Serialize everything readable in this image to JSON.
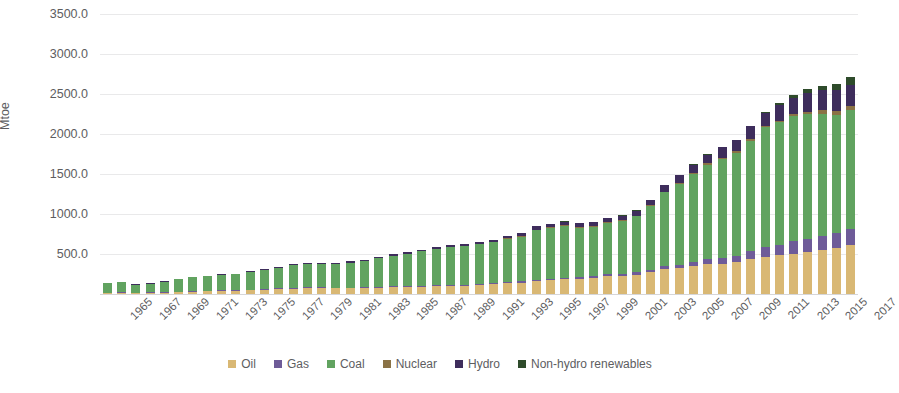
{
  "chart_data": {
    "type": "bar",
    "subtype": "stacked-column",
    "title": "",
    "xlabel": "",
    "ylabel": "Mtoe",
    "ylim": [
      0,
      3500
    ],
    "ytick_values": [
      0,
      500,
      1000,
      1500,
      2000,
      2500,
      3000,
      3500
    ],
    "ytick_labels": [
      "0.0",
      "500.0",
      "1000.0",
      "1500.0",
      "2000.0",
      "2500.0",
      "3000.0",
      "3500.0"
    ],
    "grid": true,
    "grid_axis": "y",
    "legend_position": "bottom",
    "x_tick_rotation": -45,
    "x_tick_step": 2,
    "categories": [
      "1965",
      "1966",
      "1967",
      "1968",
      "1969",
      "1970",
      "1971",
      "1972",
      "1973",
      "1974",
      "1975",
      "1976",
      "1977",
      "1978",
      "1979",
      "1980",
      "1981",
      "1982",
      "1983",
      "1984",
      "1985",
      "1986",
      "1987",
      "1988",
      "1989",
      "1990",
      "1991",
      "1992",
      "1993",
      "1994",
      "1995",
      "1996",
      "1997",
      "1998",
      "1999",
      "2000",
      "2001",
      "2002",
      "2003",
      "2004",
      "2005",
      "2006",
      "2007",
      "2008",
      "2009",
      "2010",
      "2011",
      "2012",
      "2013",
      "2014",
      "2015",
      "2016",
      "2017"
    ],
    "xtick_labels": [
      "1965",
      "1967",
      "1969",
      "1971",
      "1973",
      "1975",
      "1977",
      "1979",
      "1981",
      "1983",
      "1985",
      "1987",
      "1989",
      "1991",
      "1993",
      "1995",
      "1997",
      "1999",
      "2001",
      "2003",
      "2005",
      "2007",
      "2009",
      "2011",
      "2013",
      "2015",
      "2017"
    ],
    "series": [
      {
        "name": "Oil",
        "color": "#d9b874",
        "values": [
          11.0,
          13.5,
          11.0,
          12.5,
          16.5,
          22.0,
          28.0,
          32.0,
          38.0,
          41.0,
          48.0,
          52.0,
          60.0,
          68.0,
          74.0,
          74.0,
          70.0,
          70.0,
          72.0,
          77.0,
          83.0,
          88.0,
          92.0,
          97.0,
          102.0,
          104.0,
          113.0,
          123.0,
          136.0,
          142.0,
          159.0,
          170.0,
          187.0,
          190.0,
          204.0,
          224.0,
          226.0,
          243.0,
          269.0,
          317.0,
          326.0,
          352.0,
          375.0,
          381.0,
          400.0,
          442.0,
          465.0,
          487.0,
          506.0,
          523.0,
          553.0,
          577.0,
          608.0
        ]
      },
      {
        "name": "Gas",
        "color": "#6e5b98",
        "values": [
          0.9,
          1.1,
          1.0,
          1.2,
          1.5,
          2.2,
          3.0,
          3.8,
          4.8,
          6.0,
          7.5,
          9.0,
          10.5,
          12.0,
          13.0,
          12.5,
          11.5,
          11.0,
          11.0,
          11.5,
          11.5,
          12.0,
          12.5,
          12.8,
          13.5,
          13.5,
          14.0,
          14.5,
          15.0,
          15.5,
          15.5,
          16.0,
          17.0,
          17.5,
          19.5,
          21.0,
          23.5,
          26.5,
          30.0,
          35.0,
          42.0,
          51.0,
          63.0,
          73.0,
          80.0,
          99.0,
          118.0,
          132.0,
          153.0,
          168.0,
          175.0,
          186.0,
          206.0
        ]
      },
      {
        "name": "Coal",
        "color": "#61a360",
        "values": [
          114.0,
          124.0,
          97.0,
          109.0,
          131.0,
          155.0,
          173.0,
          183.0,
          192.0,
          196.0,
          225.0,
          238.0,
          259.0,
          281.0,
          291.0,
          292.0,
          291.0,
          310.0,
          330.0,
          360.0,
          386.0,
          403.0,
          429.0,
          454.0,
          468.0,
          477.0,
          496.0,
          512.0,
          536.0,
          561.0,
          624.0,
          644.0,
          646.0,
          619.0,
          615.0,
          642.0,
          663.0,
          700.0,
          800.0,
          917.0,
          1013.0,
          1102.0,
          1181.0,
          1233.0,
          1286.0,
          1376.0,
          1504.0,
          1526.0,
          1563.0,
          1557.0,
          1528.0,
          1479.0,
          1482.0
        ]
      },
      {
        "name": "Nuclear",
        "color": "#8a7245",
        "values": [
          0.0,
          0.0,
          0.0,
          0.0,
          0.0,
          0.0,
          0.0,
          0.0,
          0.0,
          0.0,
          0.0,
          0.0,
          0.0,
          0.0,
          0.0,
          0.0,
          0.0,
          0.0,
          0.0,
          0.0,
          0.0,
          0.0,
          0.0,
          0.0,
          0.0,
          0.0,
          0.0,
          0.0,
          0.3,
          3.0,
          3.0,
          3.3,
          3.4,
          3.3,
          3.6,
          3.8,
          4.0,
          5.7,
          9.8,
          11.4,
          12.0,
          12.4,
          14.1,
          15.5,
          15.9,
          16.7,
          19.5,
          22.0,
          25.3,
          30.0,
          38.6,
          48.3,
          56.2
        ]
      },
      {
        "name": "Hydro",
        "color": "#3e2d5c",
        "values": [
          2.4,
          2.6,
          2.7,
          2.9,
          3.2,
          4.3,
          5.0,
          5.4,
          5.9,
          6.5,
          7.4,
          8.2,
          9.0,
          10.0,
          11.0,
          13.0,
          14.5,
          16.0,
          18.0,
          19.0,
          20.0,
          21.0,
          23.0,
          25.0,
          27.0,
          28.0,
          29.0,
          31.0,
          35.0,
          38.0,
          43.0,
          44.0,
          45.0,
          48.0,
          49.0,
          50.0,
          61.0,
          65.0,
          64.0,
          80.0,
          90.0,
          98.0,
          109.0,
          132.0,
          139.0,
          163.0,
          157.0,
          194.0,
          207.0,
          240.0,
          254.0,
          264.0,
          261.0
        ]
      },
      {
        "name": "Non-hydro renewables",
        "color": "#2e4b2b",
        "values": [
          0.0,
          0.0,
          0.0,
          0.0,
          0.0,
          0.0,
          0.0,
          0.0,
          0.0,
          0.0,
          0.0,
          0.0,
          0.0,
          0.0,
          0.0,
          0.0,
          0.0,
          0.0,
          0.0,
          0.0,
          0.0,
          0.0,
          0.0,
          0.0,
          0.0,
          0.0,
          0.0,
          0.0,
          0.0,
          0.0,
          0.0,
          0.0,
          0.1,
          0.1,
          0.2,
          0.3,
          0.4,
          0.5,
          0.6,
          0.8,
          1.2,
          1.6,
          2.5,
          3.6,
          5.6,
          10.0,
          17.5,
          24.0,
          33.0,
          44.0,
          56.0,
          72.0,
          94.0
        ]
      }
    ],
    "totals": [
      128.3,
      141.2,
      111.7,
      125.6,
      152.2,
      183.5,
      209.0,
      224.2,
      240.7,
      249.5,
      287.9,
      307.2,
      338.5,
      371.0,
      389.0,
      391.5,
      387.0,
      407.0,
      431.0,
      467.5,
      500.5,
      524.0,
      556.5,
      588.8,
      610.5,
      622.5,
      652.0,
      680.5,
      722.3,
      759.5,
      844.5,
      877.3,
      898.5,
      877.9,
      891.3,
      941.1,
      977.9,
      1040.7,
      1173.4,
      1361.2,
      1484.2,
      1617.0,
      1744.6,
      1838.1,
      1926.5,
      2106.7,
      2281.0,
      2385.0,
      2487.3,
      2562.0,
      2604.6,
      2626.3,
      2707.2
    ]
  },
  "legend": {
    "items": [
      {
        "label": "Oil",
        "color": "#d9b874"
      },
      {
        "label": "Gas",
        "color": "#6e5b98"
      },
      {
        "label": "Coal",
        "color": "#61a360"
      },
      {
        "label": "Nuclear",
        "color": "#8a7245"
      },
      {
        "label": "Hydro",
        "color": "#3e2d5c"
      },
      {
        "label": "Non-hydro renewables",
        "color": "#2e4b2b"
      }
    ]
  },
  "axis": {
    "y_title": "Mtoe"
  }
}
